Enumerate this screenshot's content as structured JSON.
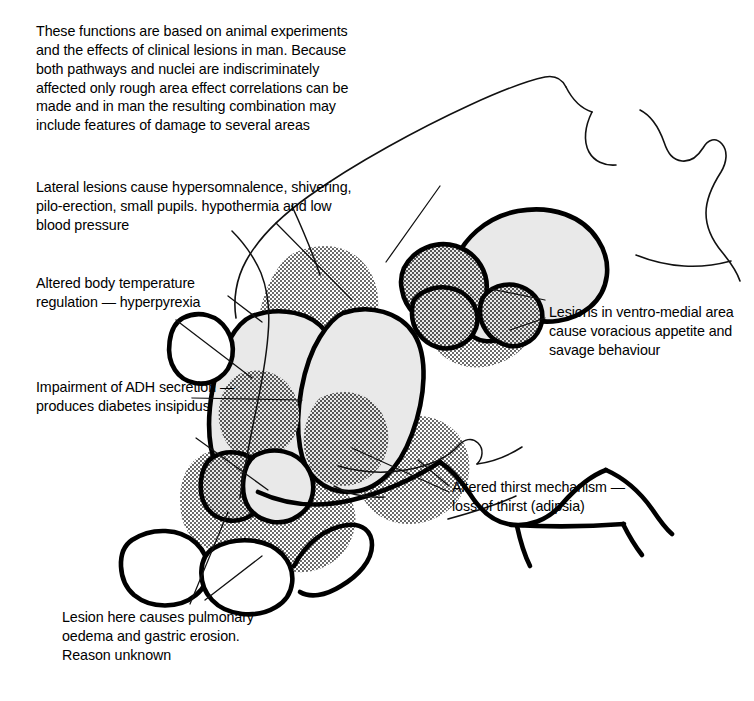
{
  "figure": {
    "background": "#ffffff",
    "ink": "#000000",
    "nucleus_fill": "#e9e9e9",
    "stipple_color": "#2b2b2b",
    "width": 754,
    "height": 701
  },
  "annotations": {
    "intro": "These functions are based on animal experiments and the effects of clinical lesions in man. Because both pathways and nuclei are indiscriminately affected only rough area effect correlations can be made and in man the resulting combination may include features of damage to several areas",
    "lateral": "Lateral lesions cause hypersomnalence, shivering, pilo-erection, small pupils. hypothermia and low blood pressure",
    "temperature": "Altered body temperature regulation — hyperpyrexia",
    "adh": "Impairment of ADH secretion — produces diabetes insipidus",
    "lesion_here": "Lesion here causes pulmonary oedema and gastric erosion. Reason unknown",
    "ventromedial": "Lesions in ventro-medial area cause voracious appetite and savage behaviour",
    "thirst": "Altered thirst mechanism — loss of thirst (adipsia)"
  }
}
